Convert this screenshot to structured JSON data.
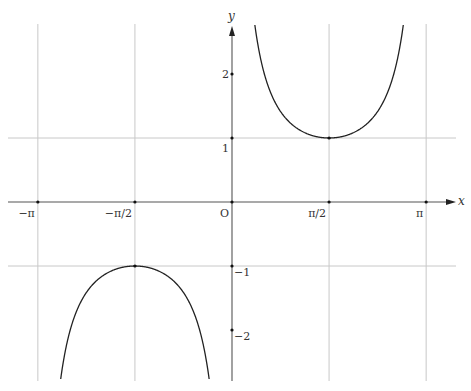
{
  "chart_data": {
    "type": "line",
    "title": "",
    "function": "y = 1/sin(x)",
    "xlabel": "x",
    "ylabel": "y",
    "xlim": [
      -3.53,
      3.63
    ],
    "ylim": [
      -2.8,
      2.8
    ],
    "grid": true,
    "x_ticks": [
      {
        "value": -3.14159,
        "label": "−π"
      },
      {
        "value": -1.5708,
        "label": "−π/2"
      },
      {
        "value": 0,
        "label": "O"
      },
      {
        "value": 1.5708,
        "label": "π/2"
      },
      {
        "value": 3.14159,
        "label": "π"
      }
    ],
    "y_ticks": [
      {
        "value": 2,
        "label": "2"
      },
      {
        "value": 1,
        "label": "1"
      },
      {
        "value": -1,
        "label": "−1"
      },
      {
        "value": -2,
        "label": "−2"
      }
    ],
    "series": [
      {
        "name": "upper branch",
        "domain": [
          0,
          3.14159
        ],
        "min_point": {
          "x": 1.5708,
          "y": 1
        }
      },
      {
        "name": "lower branch",
        "domain": [
          -3.14159,
          0
        ],
        "max_point": {
          "x": -1.5708,
          "y": -1
        }
      }
    ]
  },
  "layout": {
    "origin_px": [
      232,
      202
    ],
    "px_per_unit_x": 61.8,
    "px_per_unit_y": 64,
    "plot_top": 24,
    "plot_bottom": 381,
    "grid_left": 8,
    "grid_right": 456,
    "axis_color": "#555555",
    "grid_color": "#c8c8c8",
    "curve_color": "#222222"
  }
}
